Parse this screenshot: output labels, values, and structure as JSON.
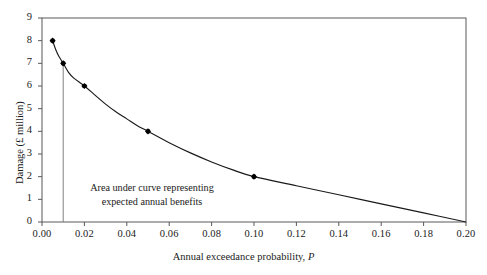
{
  "chart_data": {
    "type": "line",
    "title": "",
    "xlabel": "Annual exceedance probability, P",
    "xlabel_plain": "Annual exceedance probability,",
    "xlabel_italic": "P",
    "ylabel": "Damage (£ million)",
    "xlim": [
      0.0,
      0.2
    ],
    "ylim": [
      0,
      9
    ],
    "grid": false,
    "legend": "none",
    "xticks": [
      "0.00",
      "0.02",
      "0.04",
      "0.06",
      "0.08",
      "0.10",
      "0.12",
      "0.14",
      "0.16",
      "0.18",
      "0.20"
    ],
    "xtick_values": [
      0.0,
      0.02,
      0.04,
      0.06,
      0.08,
      0.1,
      0.12,
      0.14,
      0.16,
      0.18,
      0.2
    ],
    "yticks": [
      "0",
      "1",
      "2",
      "3",
      "4",
      "5",
      "6",
      "7",
      "8",
      "9"
    ],
    "ytick_values": [
      0,
      1,
      2,
      3,
      4,
      5,
      6,
      7,
      8,
      9
    ],
    "markers": [
      {
        "x": 0.005,
        "y": 8
      },
      {
        "x": 0.01,
        "y": 7
      },
      {
        "x": 0.02,
        "y": 6
      },
      {
        "x": 0.05,
        "y": 4
      },
      {
        "x": 0.1,
        "y": 2
      }
    ],
    "curve": [
      {
        "x": 0.005,
        "y": 8.0
      },
      {
        "x": 0.0065,
        "y": 7.6
      },
      {
        "x": 0.008,
        "y": 7.3
      },
      {
        "x": 0.01,
        "y": 7.0
      },
      {
        "x": 0.0125,
        "y": 6.6
      },
      {
        "x": 0.015,
        "y": 6.35
      },
      {
        "x": 0.02,
        "y": 6.0
      },
      {
        "x": 0.025,
        "y": 5.6
      },
      {
        "x": 0.03,
        "y": 5.2
      },
      {
        "x": 0.035,
        "y": 4.85
      },
      {
        "x": 0.04,
        "y": 4.55
      },
      {
        "x": 0.045,
        "y": 4.25
      },
      {
        "x": 0.05,
        "y": 4.0
      },
      {
        "x": 0.06,
        "y": 3.5
      },
      {
        "x": 0.07,
        "y": 3.05
      },
      {
        "x": 0.08,
        "y": 2.65
      },
      {
        "x": 0.09,
        "y": 2.3
      },
      {
        "x": 0.1,
        "y": 2.0
      },
      {
        "x": 0.12,
        "y": 1.6
      },
      {
        "x": 0.14,
        "y": 1.2
      },
      {
        "x": 0.16,
        "y": 0.8
      },
      {
        "x": 0.18,
        "y": 0.4
      },
      {
        "x": 0.2,
        "y": 0.0
      }
    ],
    "vertical_line": {
      "x": 0.01,
      "y_top": 7,
      "y_bottom": 0
    },
    "annotation": {
      "line1": "Area under curve representing",
      "line2": "expected annual benefits"
    },
    "colors": {
      "curve": "#1a1a1a",
      "marker": "#000000",
      "axis": "#595959",
      "vertical_line": "#808080",
      "background": "#ffffff"
    }
  }
}
